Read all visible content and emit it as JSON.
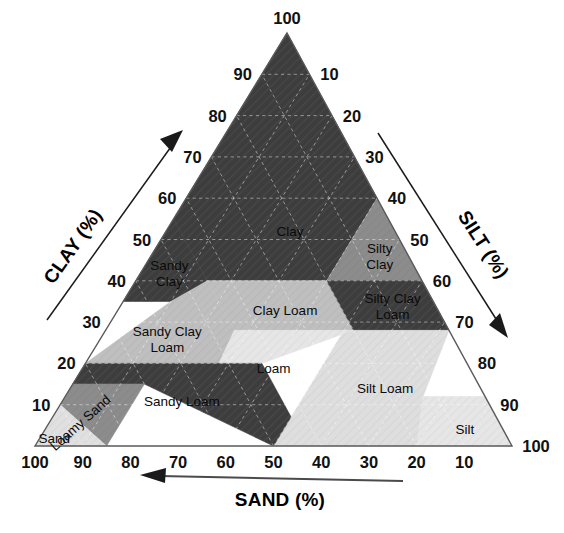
{
  "axes": {
    "clay": {
      "name": "CLAY (%)",
      "ticks": [
        "10",
        "20",
        "30",
        "40",
        "50",
        "60",
        "70",
        "80",
        "90",
        "100"
      ],
      "arrow": "up-right-arrow"
    },
    "silt": {
      "name": "SILT (%)",
      "ticks": [
        "10",
        "20",
        "30",
        "40",
        "50",
        "60",
        "70",
        "80",
        "90",
        "100"
      ],
      "arrow": "down-right-arrow"
    },
    "sand": {
      "name": "SAND (%)",
      "ticks": [
        "100",
        "90",
        "80",
        "70",
        "60",
        "50",
        "40",
        "30",
        "20",
        "10"
      ],
      "arrow": "left-arrow"
    },
    "apex_label": "100",
    "bottom_right_label": "100",
    "bottom_left_label": "100"
  },
  "regions": [
    {
      "id": "clay",
      "label": "Clay",
      "lines": [
        "Clay"
      ],
      "shade": "#3d3d3d",
      "text_color": "#ffffff"
    },
    {
      "id": "silty-clay",
      "label": "Silty Clay",
      "lines": [
        "Silty",
        "Clay"
      ],
      "shade": "#8c8c8c",
      "text_color": "#0b0b0b"
    },
    {
      "id": "sandy-clay",
      "label": "Sandy Clay",
      "lines": [
        "Sandy",
        "Clay"
      ],
      "shade": "#3d3d3d",
      "text_color": "#ffffff"
    },
    {
      "id": "clay-loam",
      "label": "Clay Loam",
      "lines": [
        "Clay Loam"
      ],
      "shade": "#bfbfbf",
      "text_color": "#0b0b0b"
    },
    {
      "id": "silty-clay-loam",
      "label": "Silty Clay Loam",
      "lines": [
        "Silty Clay",
        "Loam"
      ],
      "shade": "#3d3d3d",
      "text_color": "#ffffff"
    },
    {
      "id": "sandy-clay-loam",
      "label": "Sandy Clay Loam",
      "lines": [
        "Sandy Clay",
        "Loam"
      ],
      "shade": "#bfbfbf",
      "text_color": "#0b0b0b"
    },
    {
      "id": "loam",
      "label": "Loam",
      "lines": [
        "Loam"
      ],
      "shade": "#e6e6e6",
      "text_color": "#0b0b0b"
    },
    {
      "id": "silt-loam",
      "label": "Silt Loam",
      "lines": [
        "Silt Loam"
      ],
      "shade": "#dedede",
      "text_color": "#0b0b0b"
    },
    {
      "id": "silt",
      "label": "Silt",
      "lines": [
        "Silt"
      ],
      "shade": "#e6e6e6",
      "text_color": "#0b0b0b"
    },
    {
      "id": "sandy-loam",
      "label": "Sandy Loam",
      "lines": [
        "Sandy Loam"
      ],
      "shade": "#3d3d3d",
      "text_color": "#ffffff"
    },
    {
      "id": "loamy-sand",
      "label": "Loamy Sand",
      "lines": [
        "Loamy Sand"
      ],
      "shade": "#8c8c8c",
      "text_color": "#0b0b0b"
    },
    {
      "id": "sand",
      "label": "Sand",
      "lines": [
        "Sand"
      ],
      "shade": "#e0e0e0",
      "text_color": "#0b0b0b"
    }
  ],
  "chart_data": {
    "type": "ternary",
    "axis_names": [
      "SAND (%)",
      "SILT (%)",
      "CLAY (%)"
    ],
    "axis_ranges": [
      [
        0,
        100
      ],
      [
        0,
        100
      ],
      [
        0,
        100
      ]
    ],
    "tick_step": 10,
    "grid": true,
    "legend": "none",
    "classes": [
      {
        "name": "Clay",
        "shade": "#3d3d3d",
        "vertices_sand_silt_clay": [
          [
            0,
            40,
            60
          ],
          [
            0,
            0,
            100
          ],
          [
            45,
            0,
            55
          ],
          [
            45,
            15,
            40
          ],
          [
            20,
            40,
            40
          ]
        ]
      },
      {
        "name": "Silty Clay",
        "shade": "#8c8c8c",
        "vertices_sand_silt_clay": [
          [
            0,
            40,
            60
          ],
          [
            20,
            40,
            40
          ],
          [
            0,
            60,
            40
          ]
        ]
      },
      {
        "name": "Sandy Clay",
        "shade": "#3d3d3d",
        "vertices_sand_silt_clay": [
          [
            45,
            15,
            40
          ],
          [
            45,
            0,
            55
          ],
          [
            65,
            0,
            35
          ],
          [
            55,
            10,
            35
          ]
        ]
      },
      {
        "name": "Clay Loam",
        "shade": "#bfbfbf",
        "vertices_sand_silt_clay": [
          [
            20,
            40,
            40
          ],
          [
            45,
            15,
            40
          ],
          [
            45,
            27,
            28
          ],
          [
            20,
            52,
            28
          ]
        ]
      },
      {
        "name": "Silty Clay Loam",
        "shade": "#3d3d3d",
        "vertices_sand_silt_clay": [
          [
            0,
            60,
            40
          ],
          [
            20,
            40,
            40
          ],
          [
            20,
            52,
            28
          ],
          [
            0,
            72,
            28
          ]
        ]
      },
      {
        "name": "Sandy Clay Loam",
        "shade": "#bfbfbf",
        "vertices_sand_silt_clay": [
          [
            45,
            27,
            28
          ],
          [
            45,
            15,
            40
          ],
          [
            55,
            10,
            35
          ],
          [
            80,
            0,
            20
          ],
          [
            52,
            28,
            20
          ]
        ]
      },
      {
        "name": "Loam",
        "shade": "#e6e6e6",
        "vertices_sand_silt_clay": [
          [
            20,
            52,
            28
          ],
          [
            45,
            27,
            28
          ],
          [
            52,
            28,
            20
          ],
          [
            43,
            37,
            20
          ],
          [
            23,
            50,
            27
          ]
        ]
      },
      {
        "name": "Silt Loam",
        "shade": "#dedede",
        "vertices_sand_silt_clay": [
          [
            0,
            72,
            28
          ],
          [
            20,
            52,
            28
          ],
          [
            23,
            50,
            27
          ],
          [
            50,
            50,
            0
          ],
          [
            20,
            80,
            0
          ],
          [
            13,
            75,
            12
          ]
        ]
      },
      {
        "name": "Silt",
        "shade": "#e6e6e6",
        "vertices_sand_silt_clay": [
          [
            20,
            80,
            0
          ],
          [
            0,
            100,
            0
          ],
          [
            0,
            88,
            12
          ],
          [
            13,
            75,
            12
          ]
        ]
      },
      {
        "name": "Sandy Loam",
        "shade": "#3d3d3d",
        "vertices_sand_silt_clay": [
          [
            43,
            37,
            20
          ],
          [
            52,
            28,
            20
          ],
          [
            80,
            0,
            20
          ],
          [
            85,
            0,
            15
          ],
          [
            70,
            15,
            15
          ],
          [
            50,
            50,
            0
          ],
          [
            43,
            50,
            7
          ]
        ]
      },
      {
        "name": "Loamy Sand",
        "shade": "#8c8c8c",
        "vertices_sand_silt_clay": [
          [
            85,
            0,
            15
          ],
          [
            90,
            0,
            10
          ],
          [
            85,
            15,
            0
          ],
          [
            70,
            15,
            15
          ]
        ]
      },
      {
        "name": "Sand",
        "shade": "#e0e0e0",
        "vertices_sand_silt_clay": [
          [
            90,
            0,
            10
          ],
          [
            100,
            0,
            0
          ],
          [
            85,
            15,
            0
          ]
        ]
      }
    ]
  }
}
